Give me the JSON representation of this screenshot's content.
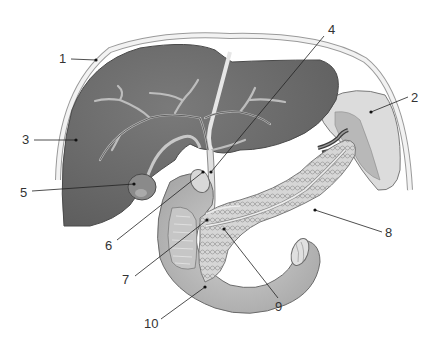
{
  "diagram": {
    "type": "anatomical-illustration",
    "colors": {
      "liver": "#6e6e6e",
      "liver_dark": "#5e5e5e",
      "ducts": "#c8c8c8",
      "duodenum": "#bdbdbd",
      "pancreas": "#d4d4d4",
      "spleen": "#d8d8d8",
      "peritoneum": "#e8e8e8",
      "leader": "#222222",
      "text": "#333333"
    },
    "labels": [
      {
        "id": "1",
        "text": "1",
        "x": 59,
        "y": 52,
        "point": [
          96,
          60
        ]
      },
      {
        "id": "2",
        "text": "2",
        "x": 411,
        "y": 91,
        "point": [
          371,
          112
        ]
      },
      {
        "id": "3",
        "text": "3",
        "x": 22,
        "y": 133,
        "point": [
          76,
          140
        ]
      },
      {
        "id": "4",
        "text": "4",
        "x": 328,
        "y": 23,
        "point": [
          211,
          172
        ]
      },
      {
        "id": "5",
        "text": "5",
        "x": 20,
        "y": 187,
        "point": [
          134,
          184
        ]
      },
      {
        "id": "6",
        "text": "6",
        "x": 104,
        "y": 238,
        "point": [
          203,
          172
        ]
      },
      {
        "id": "7",
        "text": "7",
        "x": 122,
        "y": 272,
        "point": [
          207,
          220
        ]
      },
      {
        "id": "8",
        "text": "8",
        "x": 385,
        "y": 226,
        "point": [
          315,
          210
        ]
      },
      {
        "id": "9",
        "text": "9",
        "x": 276,
        "y": 300,
        "point": [
          224,
          229
        ]
      },
      {
        "id": "10",
        "text": "10",
        "x": 146,
        "y": 318,
        "point": [
          205,
          287
        ]
      }
    ]
  }
}
